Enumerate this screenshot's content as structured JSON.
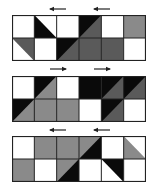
{
  "colors": {
    "white": "#ffffff",
    "black": "#0a0a0a",
    "gray": "#8a8a8a",
    "dark_gray": "#5a5a5a",
    "grid": "#222222"
  },
  "panels": [
    {
      "id": "panel-1",
      "top": 15,
      "arrows": [
        {
          "direction": "left",
          "x": 48,
          "y": 9
        },
        {
          "direction": "left",
          "x": 92,
          "y": 9
        }
      ],
      "cells": [
        {
          "col": 0,
          "row": 0,
          "fill": "white"
        },
        {
          "col": 1,
          "row": 0,
          "fill": "white",
          "tri": "lower-left",
          "tri_fill": "black"
        },
        {
          "col": 2,
          "row": 0,
          "fill": "white"
        },
        {
          "col": 3,
          "row": 0,
          "fill": "black",
          "tri": "lower-right",
          "tri_fill": "dark_gray"
        },
        {
          "col": 4,
          "row": 0,
          "fill": "white"
        },
        {
          "col": 5,
          "row": 0,
          "fill": "gray"
        },
        {
          "col": 0,
          "row": 1,
          "fill": "white",
          "tri": "upper-right",
          "tri_fill": "dark_gray"
        },
        {
          "col": 1,
          "row": 1,
          "fill": "white"
        },
        {
          "col": 2,
          "row": 1,
          "fill": "black",
          "tri": "lower-right",
          "tri_fill": "dark_gray"
        },
        {
          "col": 3,
          "row": 1,
          "fill": "dark_gray"
        },
        {
          "col": 4,
          "row": 1,
          "fill": "dark_gray"
        },
        {
          "col": 5,
          "row": 1,
          "fill": "white"
        }
      ]
    },
    {
      "id": "panel-2",
      "top": 76,
      "arrows": [
        {
          "direction": "right",
          "x": 48,
          "y": 69
        },
        {
          "direction": "right",
          "x": 92,
          "y": 69
        }
      ],
      "cells": [
        {
          "col": 0,
          "row": 0,
          "fill": "white"
        },
        {
          "col": 1,
          "row": 0,
          "fill": "black",
          "tri": "lower-right",
          "tri_fill": "gray"
        },
        {
          "col": 2,
          "row": 0,
          "fill": "white"
        },
        {
          "col": 3,
          "row": 0,
          "fill": "black"
        },
        {
          "col": 4,
          "row": 0,
          "fill": "black",
          "tri": "lower-right",
          "tri_fill": "dark_gray"
        },
        {
          "col": 5,
          "row": 0,
          "fill": "black",
          "tri": "lower-right",
          "tri_fill": "dark_gray"
        },
        {
          "col": 0,
          "row": 1,
          "fill": "black",
          "tri": "lower-right",
          "tri_fill": "gray"
        },
        {
          "col": 1,
          "row": 1,
          "fill": "gray"
        },
        {
          "col": 2,
          "row": 1,
          "fill": "gray"
        },
        {
          "col": 3,
          "row": 1,
          "fill": "white"
        },
        {
          "col": 4,
          "row": 1,
          "fill": "black",
          "tri": "lower-right",
          "tri_fill": "dark_gray"
        },
        {
          "col": 5,
          "row": 1,
          "fill": "white"
        }
      ]
    },
    {
      "id": "panel-3",
      "top": 136,
      "arrows": [
        {
          "direction": "left",
          "x": 48,
          "y": 130
        },
        {
          "direction": "left",
          "x": 92,
          "y": 130
        }
      ],
      "cells": [
        {
          "col": 0,
          "row": 0,
          "fill": "white"
        },
        {
          "col": 1,
          "row": 0,
          "fill": "gray"
        },
        {
          "col": 2,
          "row": 0,
          "fill": "gray"
        },
        {
          "col": 3,
          "row": 0,
          "fill": "gray",
          "tri": "lower-right",
          "tri_fill": "black"
        },
        {
          "col": 4,
          "row": 0,
          "fill": "white"
        },
        {
          "col": 5,
          "row": 0,
          "fill": "white",
          "tri": "lower-left",
          "tri_fill": "gray"
        },
        {
          "col": 0,
          "row": 1,
          "fill": "gray"
        },
        {
          "col": 1,
          "row": 1,
          "fill": "white"
        },
        {
          "col": 2,
          "row": 1,
          "fill": "gray",
          "tri": "lower-right",
          "tri_fill": "black"
        },
        {
          "col": 3,
          "row": 1,
          "fill": "white"
        },
        {
          "col": 4,
          "row": 1,
          "fill": "white",
          "tri": "upper-right",
          "tri_fill": "black"
        },
        {
          "col": 5,
          "row": 1,
          "fill": "white"
        }
      ]
    }
  ],
  "grid": {
    "cols": 6,
    "rows": 2,
    "cell_w": 22.33,
    "cell_h": 23
  }
}
